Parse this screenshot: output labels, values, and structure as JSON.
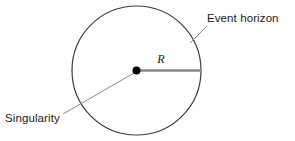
{
  "figure": {
    "background_color": "#ffffff"
  },
  "labels": {
    "event_horizon": "Event horizon",
    "singularity": "Singularity",
    "radius_symbol": "R"
  },
  "colors": {
    "circle_stroke": "#3a3a3a",
    "radius_line": "#888888",
    "leader_line": "#8a8a8a",
    "dot_fill": "#000000",
    "text": "#1a1a1a"
  },
  "geometry": {
    "circle_center_x": 136.5,
    "circle_center_y": 70.5,
    "circle_radius": 64.5,
    "dot_radius": 4,
    "radius_line_from_x": 136.5,
    "radius_line_from_y": 70.5,
    "radius_line_to_x": 201,
    "radius_line_to_y": 70.5,
    "event_horizon_leader_x1": 207,
    "event_horizon_leader_y1": 26,
    "event_horizon_leader_x2": 190,
    "event_horizon_leader_y2": 43,
    "singularity_leader_x1": 63,
    "singularity_leader_y1": 114,
    "singularity_leader_x2": 134,
    "singularity_leader_y2": 73
  },
  "text_positions": {
    "event_horizon_x": 207,
    "event_horizon_y": 22,
    "singularity_x": 5,
    "singularity_y": 122,
    "radius_symbol_x": 161,
    "radius_symbol_y": 63
  }
}
